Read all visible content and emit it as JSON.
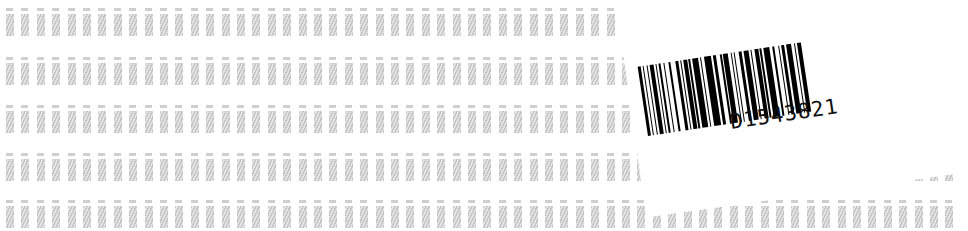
{
  "image": {
    "description": "Sheet of small gray hatched label tiles in rows with a rotated white barcode label overlaid on the right",
    "background_color": "#ffffff",
    "tile_color": "#c4c4c4"
  },
  "grid": {
    "rows": [
      8,
      57,
      105,
      153,
      200
    ],
    "row_height": 26,
    "column_start": 6,
    "column_pitch": 15.4,
    "columns": 62
  },
  "barcode_label": {
    "code": "D1543821",
    "rotation_deg": -8.5,
    "bar_color": "#000000"
  }
}
